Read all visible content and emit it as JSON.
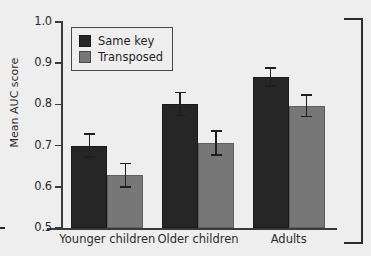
{
  "chart_data": {
    "type": "bar",
    "title": "",
    "xlabel": "",
    "ylabel": "Mean AUC score",
    "ylim": [
      0.5,
      1.0
    ],
    "yticks": [
      "1.0",
      "0.9",
      "0.8",
      "0.7",
      "0.6",
      "0.5"
    ],
    "ytick_values": [
      1.0,
      0.9,
      0.8,
      0.7,
      0.6,
      0.5
    ],
    "grid": false,
    "legend_position": "upper left",
    "categories": [
      "Younger children",
      "Older children",
      "Adults"
    ],
    "series": [
      {
        "name": "Same key",
        "color": "#262626",
        "values": [
          0.7,
          0.801,
          0.867
        ],
        "errors": [
          0.028,
          0.028,
          0.022
        ]
      },
      {
        "name": "Transposed",
        "color": "#777777",
        "values": [
          0.628,
          0.706,
          0.797
        ],
        "errors": [
          0.029,
          0.029,
          0.026
        ]
      }
    ]
  },
  "figure": {
    "background_color": "#eeeeee",
    "axis_color": "#3a3a3a",
    "bracket_label": "right-bracket-annotation"
  },
  "legend": {
    "entries": [
      {
        "label": "Same key",
        "swatch": "dark-square-swatch"
      },
      {
        "label": "Transposed",
        "swatch": "gray-square-swatch"
      }
    ]
  }
}
